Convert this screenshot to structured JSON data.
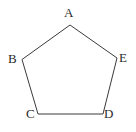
{
  "figure": {
    "name": "regular-pentagon-abcde",
    "shape_type": "pentagon",
    "background_color": "#ffffff",
    "stroke_color": "#3a3a3a",
    "stroke_width": 1,
    "fill": "none",
    "label_color": "#2b2b2b",
    "polygon_points": "70,25 22,59.5 38,114 103,114 117,58",
    "vertices": [
      {
        "id": "A",
        "label": "A",
        "x": 70,
        "y": 25
      },
      {
        "id": "B",
        "label": "B",
        "x": 22,
        "y": 59.5
      },
      {
        "id": "C",
        "label": "C",
        "x": 38,
        "y": 114
      },
      {
        "id": "D",
        "label": "D",
        "x": 103,
        "y": 114
      },
      {
        "id": "E",
        "label": "E",
        "x": 117,
        "y": 58
      }
    ],
    "edges": [
      {
        "id": "AB",
        "from": "A",
        "to": "B"
      },
      {
        "id": "BC",
        "from": "B",
        "to": "C"
      },
      {
        "id": "CD",
        "from": "C",
        "to": "D"
      },
      {
        "id": "DE",
        "from": "D",
        "to": "E"
      },
      {
        "id": "EA",
        "from": "E",
        "to": "A"
      }
    ]
  }
}
